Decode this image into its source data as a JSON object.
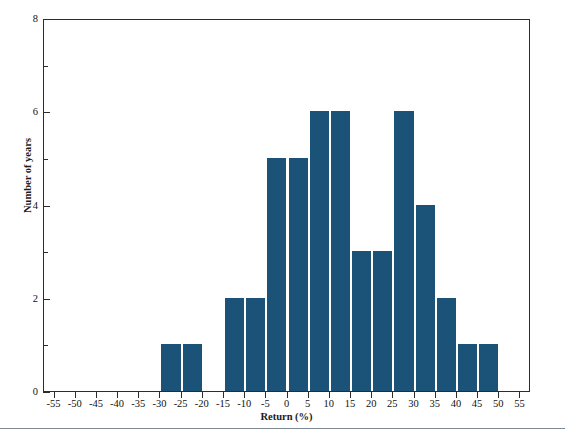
{
  "figure": {
    "title_partial": "Exhibit 1. Annual Returns",
    "bar_color": "#1a5377",
    "axis_color": "#2c2c2c",
    "rule_color": "#7d8a93"
  },
  "chart_data": {
    "type": "bar",
    "title": "",
    "xlabel": "Return (%)",
    "ylabel": "Number of years",
    "xlim": [
      -57.5,
      57.5
    ],
    "ylim": [
      0,
      8
    ],
    "grid": false,
    "legend": null,
    "bin_width": 5,
    "x_ticks": [
      -55,
      -50,
      -45,
      -40,
      -35,
      -30,
      -25,
      -20,
      -15,
      -10,
      -5,
      0,
      5,
      10,
      15,
      20,
      25,
      30,
      35,
      40,
      45,
      50,
      55
    ],
    "x_tick_labels": [
      "-55",
      "-50",
      "-45",
      "-40",
      "-35",
      "-30",
      "-25",
      "-20",
      "-15",
      "-10",
      "-5",
      "0",
      "5",
      "10",
      "15",
      "20",
      "25",
      "30",
      "35",
      "40",
      "45",
      "50",
      "55"
    ],
    "y_ticks_major": [
      0,
      2,
      4,
      6,
      8
    ],
    "y_tick_labels": [
      "0",
      "2",
      "4",
      "6",
      "8"
    ],
    "y_ticks_minor": [
      1,
      3,
      5,
      7
    ],
    "categories": [
      "-55 to -50",
      "-50 to -45",
      "-45 to -40",
      "-40 to -35",
      "-35 to -30",
      "-30 to -25",
      "-25 to -20",
      "-20 to -15",
      "-15 to -10",
      "-10 to -5",
      "-5 to 0",
      "0 to 5",
      "5 to 10",
      "10 to 15",
      "15 to 20",
      "20 to 25",
      "25 to 30",
      "30 to 35",
      "35 to 40",
      "40 to 45",
      "45 to 50",
      "50 to 55"
    ],
    "bin_starts": [
      -55,
      -50,
      -45,
      -40,
      -35,
      -30,
      -25,
      -20,
      -15,
      -10,
      -5,
      0,
      5,
      10,
      15,
      20,
      25,
      30,
      35,
      40,
      45,
      50
    ],
    "values": [
      0,
      0,
      0,
      0,
      0,
      1,
      1,
      0,
      2,
      2,
      5,
      5,
      6,
      6,
      3,
      3,
      6,
      4,
      2,
      1,
      1,
      0
    ]
  }
}
